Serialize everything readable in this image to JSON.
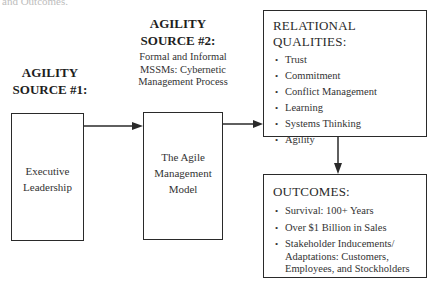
{
  "top_fragment": "and Outcomes.",
  "source1": {
    "heading_line1": "AGILITY",
    "heading_line2": "SOURCE #1:",
    "box_line1": "Executive",
    "box_line2": "Leadership"
  },
  "source2": {
    "heading_line1": "AGILITY",
    "heading_line2": "SOURCE #2:",
    "desc_line1": "Formal and Informal",
    "desc_line2": "MSSMs: Cybernetic",
    "desc_line3": "Management Process",
    "box_line1": "The Agile",
    "box_line2": "Management",
    "box_line3": "Model"
  },
  "relational": {
    "title": "RELATIONAL QUALITIES:",
    "items": [
      "Trust",
      "Commitment",
      "Conflict Management",
      "Learning",
      "Systems Thinking",
      "Agility"
    ]
  },
  "outcomes": {
    "title": "OUTCOMES:",
    "items": [
      "Survival: 100+ Years",
      "Over $1 Billion in Sales"
    ],
    "item3_line1": "Stakeholder Inducements/",
    "item3_line2": "Adaptations: Customers,",
    "item3_line3": "Employees, and Stockholders"
  },
  "colors": {
    "line": "#2a2a2a",
    "text": "#333333",
    "background": "#ffffff"
  }
}
